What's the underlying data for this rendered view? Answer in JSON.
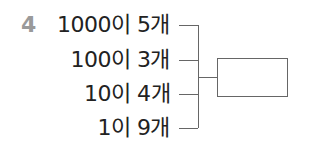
{
  "problem": {
    "number": "4",
    "rows": [
      {
        "text": "1000이 5개"
      },
      {
        "text": "100이 3개"
      },
      {
        "text": "10이 4개"
      },
      {
        "text": "1이 9개"
      }
    ],
    "answer_box": ""
  }
}
